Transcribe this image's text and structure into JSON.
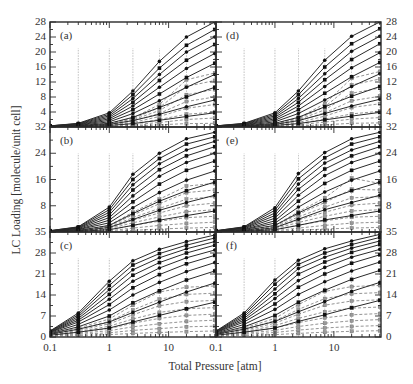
{
  "chart_data": {
    "type": "line",
    "title": "",
    "xlabel": "Total Pressure [atm]",
    "ylabel": "LC Loading [molecule/unit cell]",
    "xscale": "log",
    "xlim": [
      0.1,
      63
    ],
    "xticks": [
      0.1,
      1,
      10
    ],
    "xtick_labels": [
      "0.1",
      "1",
      "10"
    ],
    "grid": false,
    "legend": null,
    "layout": {
      "rows": 3,
      "cols": 2,
      "shared_x": true
    },
    "x": [
      0.1,
      0.3,
      1,
      2.5,
      7,
      20,
      60
    ],
    "panels": [
      {
        "label": "(a)",
        "row": 0,
        "col": 0,
        "ylim": [
          0,
          28
        ],
        "yticks": [
          4,
          8,
          12,
          16,
          20,
          24,
          28
        ],
        "ytick_side": "left",
        "solid_series": [
          [
            0.3,
            1.0,
            3.8,
            9.6,
            17.5,
            24.0,
            28.0
          ],
          [
            0.3,
            0.9,
            3.4,
            8.6,
            15.7,
            21.8,
            26.0
          ],
          [
            0.3,
            0.8,
            3.0,
            7.6,
            14.0,
            20.0,
            24.0
          ],
          [
            0.2,
            0.7,
            2.6,
            6.6,
            12.4,
            17.8,
            22.0
          ],
          [
            0.2,
            0.6,
            2.2,
            5.6,
            10.6,
            15.6,
            19.6
          ],
          [
            0.2,
            0.5,
            1.8,
            4.6,
            8.8,
            13.2,
            17.0
          ],
          [
            0.1,
            0.4,
            1.4,
            3.6,
            7.0,
            10.6,
            14.0
          ],
          [
            0.1,
            0.3,
            1.0,
            2.6,
            5.2,
            8.0,
            10.6
          ],
          [
            0.1,
            0.2,
            0.7,
            1.7,
            3.4,
            5.4,
            7.2
          ],
          [
            0.0,
            0.1,
            0.4,
            0.9,
            1.8,
            2.8,
            3.8
          ]
        ],
        "dashed_series": [
          [
            0.1,
            0.3,
            1.0,
            2.4,
            6.0,
            12.6,
            14.4
          ],
          [
            0.1,
            0.3,
            0.9,
            2.2,
            5.2,
            10.8,
            12.4
          ],
          [
            0.1,
            0.2,
            0.8,
            1.9,
            4.4,
            8.6,
            10.0
          ],
          [
            0.1,
            0.2,
            0.6,
            1.6,
            3.6,
            6.8,
            8.0
          ],
          [
            0.0,
            0.2,
            0.5,
            1.2,
            2.8,
            5.0,
            6.0
          ],
          [
            0.0,
            0.1,
            0.4,
            0.9,
            2.0,
            3.4,
            4.0
          ],
          [
            0.0,
            0.1,
            0.2,
            0.6,
            1.2,
            2.0,
            2.4
          ],
          [
            0.0,
            0.0,
            0.1,
            0.3,
            0.6,
            0.9,
            1.0
          ]
        ]
      },
      {
        "label": "(b)",
        "row": 1,
        "col": 0,
        "ylim": [
          0,
          32
        ],
        "yticks": [
          8,
          16,
          24,
          32
        ],
        "ytick_side": "left",
        "solid_series": [
          [
            0.4,
            1.6,
            7.6,
            17.6,
            24.0,
            28.4,
            30.4
          ],
          [
            0.4,
            1.5,
            6.8,
            16.0,
            22.4,
            26.8,
            29.0
          ],
          [
            0.3,
            1.3,
            6.0,
            14.4,
            20.8,
            25.0,
            27.6
          ],
          [
            0.3,
            1.2,
            5.2,
            12.8,
            19.0,
            23.2,
            26.0
          ],
          [
            0.3,
            1.0,
            4.4,
            11.0,
            17.0,
            21.2,
            24.0
          ],
          [
            0.2,
            0.8,
            3.6,
            9.2,
            14.6,
            18.8,
            21.6
          ],
          [
            0.2,
            0.7,
            2.8,
            7.4,
            12.0,
            15.8,
            18.6
          ],
          [
            0.1,
            0.5,
            2.0,
            5.6,
            9.4,
            12.6,
            15.2
          ],
          [
            0.1,
            0.3,
            1.4,
            3.8,
            6.6,
            9.0,
            11.2
          ],
          [
            0.0,
            0.2,
            0.7,
            2.0,
            3.6,
            5.0,
            6.4
          ]
        ],
        "dashed_series": [
          [
            0.1,
            0.5,
            2.0,
            6.0,
            10.0,
            14.0,
            14.8
          ],
          [
            0.1,
            0.4,
            1.8,
            5.2,
            8.6,
            12.0,
            12.8
          ],
          [
            0.1,
            0.4,
            1.5,
            4.4,
            7.2,
            10.0,
            10.8
          ],
          [
            0.1,
            0.3,
            1.2,
            3.6,
            5.8,
            8.0,
            8.8
          ],
          [
            0.0,
            0.2,
            1.0,
            2.8,
            4.6,
            6.2,
            6.8
          ],
          [
            0.0,
            0.2,
            0.7,
            2.0,
            3.3,
            4.4,
            4.8
          ],
          [
            0.0,
            0.1,
            0.4,
            1.2,
            2.0,
            2.6,
            3.0
          ],
          [
            0.0,
            0.0,
            0.2,
            0.5,
            0.9,
            1.2,
            1.4
          ]
        ]
      },
      {
        "label": "(c)",
        "row": 2,
        "col": 0,
        "ylim": [
          0,
          35
        ],
        "yticks": [
          0,
          7,
          14,
          21,
          28,
          35
        ],
        "ytick_side": "left",
        "solid_series": [
          [
            2.0,
            8.0,
            18.6,
            25.4,
            29.2,
            31.8,
            34.0
          ],
          [
            1.9,
            7.4,
            17.2,
            24.0,
            27.8,
            30.6,
            33.0
          ],
          [
            1.8,
            6.8,
            15.8,
            22.4,
            26.4,
            29.4,
            31.8
          ],
          [
            1.7,
            6.2,
            14.2,
            20.6,
            24.8,
            28.0,
            30.6
          ],
          [
            1.6,
            5.6,
            12.6,
            18.6,
            23.0,
            26.4,
            29.0
          ],
          [
            1.5,
            5.0,
            10.8,
            16.4,
            20.8,
            24.4,
            27.2
          ],
          [
            1.3,
            4.2,
            9.0,
            14.0,
            18.2,
            21.8,
            24.8
          ],
          [
            1.1,
            3.4,
            7.0,
            11.4,
            15.4,
            19.0,
            22.0
          ],
          [
            0.9,
            2.6,
            5.0,
            8.2,
            11.6,
            15.0,
            18.0
          ],
          [
            0.6,
            1.6,
            3.0,
            5.0,
            7.2,
            9.4,
            11.6
          ]
        ],
        "dashed_series": [
          [
            1.0,
            3.0,
            6.0,
            10.6,
            15.0,
            16.6,
            17.0
          ],
          [
            0.9,
            2.6,
            5.2,
            9.0,
            12.6,
            14.2,
            14.6
          ],
          [
            0.8,
            2.2,
            4.4,
            7.4,
            10.4,
            11.8,
            12.2
          ],
          [
            0.7,
            1.8,
            3.6,
            6.0,
            8.2,
            9.4,
            9.8
          ],
          [
            0.6,
            1.5,
            2.8,
            4.6,
            6.2,
            7.2,
            7.6
          ],
          [
            0.5,
            1.2,
            2.1,
            3.4,
            4.4,
            5.2,
            5.6
          ],
          [
            0.4,
            0.9,
            1.4,
            2.2,
            2.8,
            3.4,
            3.6
          ],
          [
            0.3,
            0.5,
            0.8,
            1.2,
            1.5,
            1.8,
            2.0
          ]
        ]
      },
      {
        "label": "(d)",
        "row": 0,
        "col": 1,
        "ylim": [
          0,
          28
        ],
        "yticks": [
          4,
          8,
          12,
          16,
          20,
          24,
          28
        ],
        "ytick_side": "right",
        "solid_series": [
          [
            0.3,
            1.0,
            3.8,
            9.6,
            17.8,
            24.2,
            28.0
          ],
          [
            0.3,
            0.9,
            3.4,
            8.6,
            16.0,
            22.2,
            26.2
          ],
          [
            0.3,
            0.8,
            3.0,
            7.6,
            14.2,
            20.2,
            24.2
          ],
          [
            0.2,
            0.7,
            2.6,
            6.6,
            12.6,
            18.0,
            22.2
          ],
          [
            0.2,
            0.6,
            2.2,
            5.6,
            10.8,
            15.8,
            19.8
          ],
          [
            0.2,
            0.5,
            1.8,
            4.6,
            9.0,
            13.4,
            17.2
          ],
          [
            0.1,
            0.4,
            1.4,
            3.6,
            7.2,
            10.8,
            14.2
          ],
          [
            0.1,
            0.3,
            1.0,
            2.6,
            5.4,
            8.2,
            10.8
          ],
          [
            0.1,
            0.2,
            0.7,
            1.7,
            3.6,
            5.6,
            7.4
          ],
          [
            0.0,
            0.1,
            0.4,
            0.9,
            1.9,
            2.9,
            3.9
          ]
        ],
        "dashed_series": [
          [
            0.1,
            0.3,
            1.0,
            2.4,
            6.2,
            13.0,
            14.8
          ],
          [
            0.1,
            0.3,
            0.9,
            2.2,
            5.4,
            11.2,
            12.8
          ],
          [
            0.1,
            0.2,
            0.8,
            1.9,
            4.6,
            9.0,
            10.4
          ],
          [
            0.1,
            0.2,
            0.6,
            1.6,
            3.8,
            7.0,
            8.2
          ],
          [
            0.0,
            0.2,
            0.5,
            1.2,
            2.9,
            5.2,
            6.2
          ],
          [
            0.0,
            0.1,
            0.4,
            0.9,
            2.1,
            3.5,
            4.2
          ],
          [
            0.0,
            0.1,
            0.2,
            0.6,
            1.3,
            2.1,
            2.5
          ],
          [
            0.0,
            0.0,
            0.1,
            0.3,
            0.6,
            1.0,
            1.1
          ]
        ]
      },
      {
        "label": "(e)",
        "row": 1,
        "col": 1,
        "ylim": [
          0,
          32
        ],
        "yticks": [
          8,
          16,
          24,
          32
        ],
        "ytick_side": "right",
        "solid_series": [
          [
            0.4,
            1.6,
            7.4,
            17.8,
            24.2,
            28.4,
            30.4
          ],
          [
            0.4,
            1.5,
            6.6,
            16.2,
            22.6,
            26.8,
            29.0
          ],
          [
            0.3,
            1.3,
            5.8,
            14.6,
            21.0,
            25.0,
            27.6
          ],
          [
            0.3,
            1.2,
            5.0,
            13.0,
            19.2,
            23.2,
            26.0
          ],
          [
            0.3,
            1.0,
            4.2,
            11.2,
            17.2,
            21.2,
            24.0
          ],
          [
            0.2,
            0.8,
            3.4,
            9.4,
            14.8,
            18.8,
            21.6
          ],
          [
            0.2,
            0.7,
            2.7,
            7.6,
            12.2,
            15.8,
            18.6
          ],
          [
            0.1,
            0.5,
            2.0,
            5.8,
            9.6,
            12.6,
            15.2
          ],
          [
            0.1,
            0.3,
            1.3,
            3.9,
            6.8,
            9.0,
            11.2
          ],
          [
            0.0,
            0.2,
            0.7,
            2.0,
            3.7,
            5.0,
            6.4
          ]
        ],
        "dashed_series": [
          [
            0.1,
            0.5,
            2.0,
            6.2,
            10.4,
            16.4,
            14.8
          ],
          [
            0.1,
            0.4,
            1.8,
            5.4,
            9.0,
            13.0,
            12.8
          ],
          [
            0.1,
            0.4,
            1.5,
            4.6,
            7.6,
            10.4,
            10.8
          ],
          [
            0.1,
            0.3,
            1.2,
            3.7,
            6.0,
            8.2,
            8.8
          ],
          [
            0.0,
            0.2,
            1.0,
            2.9,
            4.8,
            6.4,
            6.8
          ],
          [
            0.0,
            0.2,
            0.7,
            2.1,
            3.4,
            4.5,
            4.8
          ],
          [
            0.0,
            0.1,
            0.4,
            1.2,
            2.0,
            2.7,
            3.0
          ],
          [
            0.0,
            0.0,
            0.2,
            0.5,
            0.9,
            1.2,
            1.4
          ]
        ]
      },
      {
        "label": "(f)",
        "row": 2,
        "col": 1,
        "ylim": [
          0,
          35
        ],
        "yticks": [
          0,
          7,
          14,
          21,
          28,
          35
        ],
        "ytick_side": "right",
        "solid_series": [
          [
            2.0,
            8.0,
            19.0,
            25.6,
            29.4,
            32.0,
            34.2
          ],
          [
            1.9,
            7.4,
            17.6,
            24.2,
            28.0,
            30.8,
            33.2
          ],
          [
            1.8,
            6.8,
            16.0,
            22.8,
            26.6,
            29.6,
            32.0
          ],
          [
            1.7,
            6.2,
            14.4,
            21.0,
            25.0,
            28.2,
            30.8
          ],
          [
            1.6,
            5.6,
            12.8,
            18.8,
            23.2,
            26.6,
            29.2
          ],
          [
            1.5,
            5.0,
            11.0,
            16.6,
            21.0,
            24.6,
            27.4
          ],
          [
            1.3,
            4.2,
            9.2,
            14.2,
            18.4,
            22.0,
            25.0
          ],
          [
            1.1,
            3.4,
            7.2,
            11.6,
            15.6,
            19.2,
            22.2
          ],
          [
            0.9,
            2.6,
            5.2,
            8.4,
            11.8,
            15.2,
            18.2
          ],
          [
            0.6,
            1.6,
            3.0,
            5.2,
            7.4,
            9.8,
            12.2
          ]
        ],
        "dashed_series": [
          [
            1.0,
            3.0,
            6.2,
            10.8,
            15.2,
            16.8,
            17.2
          ],
          [
            0.9,
            2.6,
            5.4,
            9.2,
            12.8,
            14.4,
            14.8
          ],
          [
            0.8,
            2.2,
            4.6,
            7.6,
            10.6,
            12.0,
            12.4
          ],
          [
            0.7,
            1.8,
            3.8,
            6.2,
            8.4,
            9.6,
            10.0
          ],
          [
            0.6,
            1.5,
            3.0,
            4.8,
            6.4,
            7.4,
            7.8
          ],
          [
            0.5,
            1.2,
            2.2,
            3.5,
            4.6,
            5.4,
            5.8
          ],
          [
            0.4,
            0.9,
            1.5,
            2.3,
            3.0,
            3.5,
            3.8
          ],
          [
            0.3,
            0.5,
            0.8,
            1.2,
            1.6,
            1.9,
            2.1
          ]
        ]
      }
    ]
  },
  "style": {
    "ink": "#2a2a2a",
    "dashed_ink": "#777777",
    "background": "#ffffff"
  }
}
